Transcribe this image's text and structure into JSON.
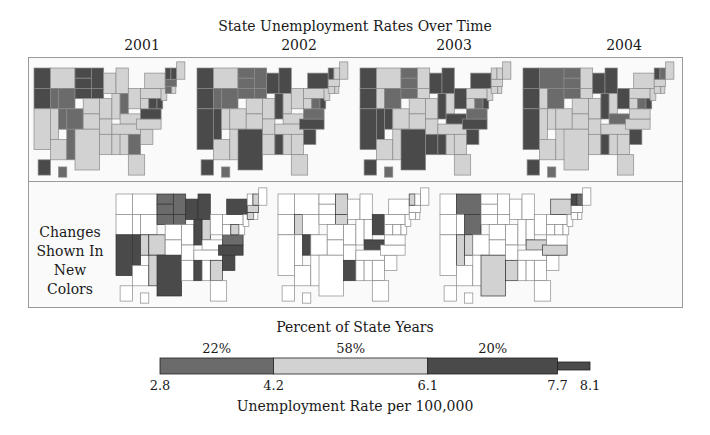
{
  "chart_data": {
    "type": "choropleth-small-multiples",
    "title": "State Unemployment Rates Over Time",
    "years": [
      "2001",
      "2002",
      "2003",
      "2004"
    ],
    "changes_label": [
      "Changes",
      "Shown In",
      "New Colors"
    ],
    "categories": [
      {
        "name": "low",
        "range": [
          2.8,
          4.2
        ],
        "percent": 22,
        "percent_label": "22%",
        "color": "#6b6b6b"
      },
      {
        "name": "medium",
        "range": [
          4.2,
          6.1
        ],
        "percent": 58,
        "percent_label": "58%",
        "color": "#d2d2d2"
      },
      {
        "name": "high",
        "range": [
          6.1,
          7.7
        ],
        "percent": 20,
        "percent_label": "20%",
        "color": "#4a4a4a"
      },
      {
        "name": "tail",
        "range": [
          7.7,
          8.1
        ],
        "percent": null,
        "percent_label": "",
        "color": "#4a4a4a"
      }
    ],
    "legend": {
      "title": "Percent of State Years",
      "xlabel": "Unemployment Rate per 100,000",
      "ticks": [
        2.8,
        4.2,
        6.1,
        7.7,
        8.1
      ],
      "tick_labels": [
        "2.8",
        "4.2",
        "6.1",
        "7.7",
        "8.1"
      ],
      "xlim": [
        2.8,
        8.1
      ]
    },
    "colors": {
      "low": "#6b6b6b",
      "medium": "#d2d2d2",
      "high": "#4a4a4a",
      "unchanged": "#ffffff",
      "border": "#8a8a8a"
    },
    "maps": {
      "2001": {
        "WA": "high",
        "OR": "high",
        "MT": "med",
        "ID": "low",
        "WY": "low",
        "ND": "high",
        "SD": "high",
        "NE": "high",
        "MN": "high",
        "IA": "high",
        "CA": "med",
        "NV": "med",
        "UT": "low",
        "CO": "low",
        "AZ": "med",
        "NM": "low",
        "TX": "med",
        "OK": "med",
        "KS": "med",
        "MO": "med",
        "WI": "med",
        "MI": "med",
        "IL": "med",
        "IN": "low",
        "OH": "med",
        "KY": "med",
        "TN": "med",
        "AR": "med",
        "LA": "med",
        "MS": "med",
        "AL": "med",
        "GA": "low",
        "FL": "med",
        "SC": "med",
        "NC": "med",
        "VA": "high",
        "WV": "med",
        "PA": "med",
        "NY": "med",
        "MD": "high",
        "DE": "high",
        "NJ": "med",
        "CT": "low",
        "RI": "med",
        "MA": "low",
        "VT": "high",
        "NH": "high",
        "ME": "med",
        "AK": "high",
        "HI": "low"
      },
      "2002": {
        "WA": "high",
        "OR": "high",
        "MT": "med",
        "ID": "low",
        "WY": "low",
        "ND": "low",
        "SD": "low",
        "NE": "low",
        "MN": "low",
        "IA": "low",
        "CA": "high",
        "NV": "high",
        "UT": "med",
        "CO": "med",
        "AZ": "med",
        "NM": "med",
        "TX": "high",
        "OK": "med",
        "KS": "med",
        "MO": "med",
        "WI": "high",
        "MI": "high",
        "IL": "high",
        "IN": "med",
        "OH": "med",
        "KY": "med",
        "TN": "med",
        "AR": "med",
        "LA": "med",
        "MS": "high",
        "AL": "med",
        "GA": "med",
        "FL": "med",
        "SC": "high",
        "NC": "high",
        "VA": "low",
        "WV": "med",
        "PA": "med",
        "NY": "high",
        "MD": "low",
        "DE": "high",
        "NJ": "med",
        "CT": "med",
        "RI": "med",
        "MA": "med",
        "VT": "high",
        "NH": "med",
        "ME": "med",
        "AK": "high",
        "HI": "low"
      },
      "2003": {
        "WA": "high",
        "OR": "high",
        "MT": "med",
        "ID": "med",
        "WY": "low",
        "ND": "low",
        "SD": "low",
        "NE": "low",
        "MN": "med",
        "IA": "med",
        "CA": "high",
        "NV": "high",
        "UT": "high",
        "CO": "med",
        "AZ": "med",
        "NM": "med",
        "TX": "high",
        "OK": "med",
        "KS": "med",
        "MO": "med",
        "WI": "high",
        "MI": "high",
        "IL": "high",
        "IN": "med",
        "OH": "high",
        "KY": "high",
        "TN": "med",
        "AR": "med",
        "LA": "high",
        "MS": "high",
        "AL": "med",
        "GA": "med",
        "FL": "med",
        "SC": "high",
        "NC": "high",
        "VA": "low",
        "WV": "med",
        "PA": "med",
        "NY": "high",
        "MD": "low",
        "DE": "high",
        "NJ": "med",
        "CT": "med",
        "RI": "med",
        "MA": "med",
        "VT": "med",
        "NH": "med",
        "ME": "med",
        "AK": "high",
        "HI": "low"
      },
      "2004": {
        "WA": "high",
        "OR": "high",
        "MT": "low",
        "ID": "med",
        "WY": "low",
        "ND": "low",
        "SD": "low",
        "NE": "low",
        "MN": "med",
        "IA": "med",
        "CA": "high",
        "NV": "med",
        "UT": "med",
        "CO": "med",
        "AZ": "med",
        "NM": "med",
        "TX": "med",
        "OK": "med",
        "KS": "med",
        "MO": "med",
        "WI": "high",
        "MI": "high",
        "IL": "high",
        "IN": "med",
        "OH": "high",
        "KY": "low",
        "TN": "med",
        "AR": "med",
        "LA": "med",
        "MS": "high",
        "AL": "med",
        "GA": "med",
        "FL": "med",
        "SC": "high",
        "NC": "med",
        "VA": "med",
        "WV": "med",
        "PA": "med",
        "NY": "med",
        "MD": "low",
        "DE": "high",
        "NJ": "med",
        "CT": "med",
        "RI": "med",
        "MA": "med",
        "VT": "high",
        "NH": "low",
        "ME": "med",
        "AK": "high",
        "HI": "low"
      }
    },
    "changes": {
      "2001-2002": {
        "CA": "high",
        "NV": "high",
        "TX": "high",
        "MS": "high",
        "WI": "high",
        "MI": "high",
        "IL": "high",
        "NY": "high",
        "SC": "high",
        "NC": "high",
        "ND": "low",
        "SD": "low",
        "NE": "low",
        "MN": "low",
        "IA": "low",
        "CO": "med",
        "UT": "med",
        "NM": "med",
        "IN": "med",
        "GA": "med",
        "VA": "low",
        "MD": "med",
        "CT": "med",
        "MA": "med",
        "NH": "med"
      },
      "2002-2003": {
        "UT": "high",
        "KY": "high",
        "OH": "high",
        "LA": "high",
        "MN": "med",
        "IA": "med",
        "ID": "med",
        "VT": "med"
      },
      "2003-2004": {
        "MT": "low",
        "WY": "low",
        "UT": "med",
        "TX": "med",
        "LA": "med",
        "NY": "med",
        "KY": "med",
        "NC": "med",
        "VT": "high",
        "NH": "low",
        "NV": "med"
      }
    }
  }
}
